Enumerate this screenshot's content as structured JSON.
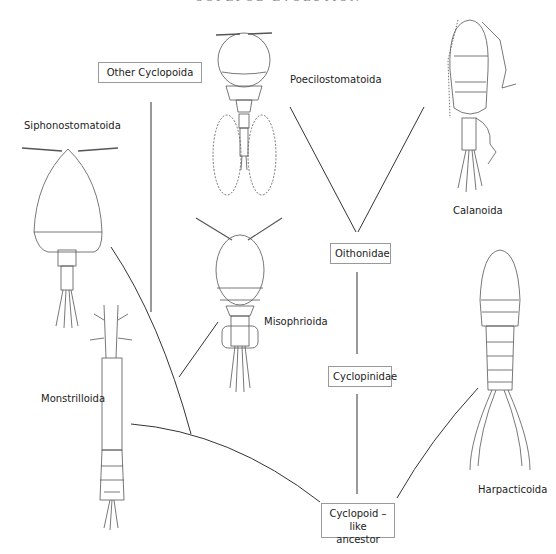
{
  "header": {
    "title": "COPEPOD EVOLUTION",
    "page_number": "14"
  },
  "nodes": {
    "other_cyclopoida": "Other Cyclopoida",
    "oithonidae": "Oithonidae",
    "cyclopinidae": "Cyclopinidae",
    "ancestor_line1": "Cyclopoid – like",
    "ancestor_line2": "ancestor"
  },
  "taxa": {
    "siphonostomatoida": "Siphonostomatoida",
    "poecilostomatoida": "Poecilostomatoida",
    "calanoida": "Calanoida",
    "misophrioida": "Misophrioida",
    "monstrilloida": "Monstrilloida",
    "harpacticoida": "Harpacticoida"
  },
  "colors": {
    "line": "#333333",
    "box_border": "#999999",
    "drawing": "#555555"
  }
}
